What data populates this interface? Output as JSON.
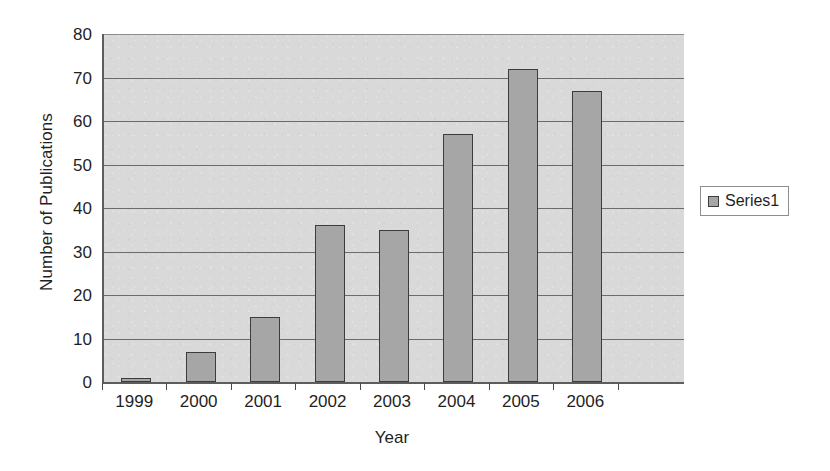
{
  "chart_data": {
    "type": "bar",
    "title": "",
    "xlabel": "Year",
    "ylabel": "Number of Publications",
    "categories": [
      "1999",
      "2000",
      "2001",
      "2002",
      "2003",
      "2004",
      "2005",
      "2006"
    ],
    "values": [
      1,
      7,
      15,
      36,
      35,
      57,
      72,
      67
    ],
    "series": [
      {
        "name": "Series1",
        "values": [
          1,
          7,
          15,
          36,
          35,
          57,
          72,
          67
        ]
      }
    ],
    "ylim": [
      0,
      80
    ],
    "ytick_labels": [
      "0",
      "10",
      "20",
      "30",
      "40",
      "50",
      "60",
      "70",
      "80"
    ],
    "ytick_values": [
      0,
      10,
      20,
      30,
      40,
      50,
      60,
      70,
      80
    ],
    "ytick_step": 10,
    "grid": "horizontal",
    "legend": {
      "position": "right",
      "entries": [
        "Series1"
      ]
    },
    "colors": {
      "bar_fill": "#a6a6a6",
      "bar_border": "#3c3c3c",
      "plot_background": "#d9d9d9",
      "gridline": "#6b6b6b",
      "axis": "#5d5d5d",
      "text": "#1f1f1f",
      "page_background": "#ffffff"
    }
  },
  "axes": {
    "y_title": "Number of Publications",
    "x_title": "Year"
  },
  "legend": {
    "swatch_name": "series-color-swatch",
    "label": "Series1"
  }
}
